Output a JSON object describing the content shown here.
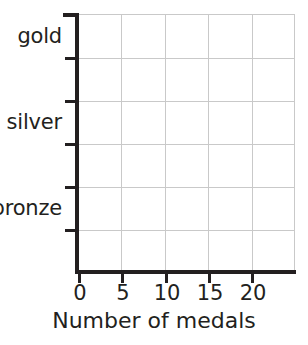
{
  "chart_data": {
    "type": "bar",
    "title": "",
    "xlabel": "Number of medals",
    "ylabel": "",
    "orientation": "horizontal",
    "categories": [
      "gold",
      "silver",
      "bronze"
    ],
    "values": [
      null,
      null,
      null
    ],
    "series": [
      {
        "name": "Number of medals",
        "values": [
          null,
          null,
          null
        ]
      }
    ],
    "x_ticks": [
      0,
      5,
      10,
      15,
      20
    ],
    "x_tick_labels": [
      "0",
      "5",
      "10",
      "15",
      "20"
    ],
    "xlim": [
      0,
      25
    ],
    "x_major_step": 5,
    "grid": "both",
    "grid_vertical_values": [
      5,
      10,
      15,
      20,
      25
    ],
    "y_band_count": 6,
    "legend": "none",
    "annotations": [],
    "note": "Empty grid template: axes, gridlines and labels only, no bars plotted.",
    "colors": {
      "axis": "#231f20",
      "gridline": "#c9c9c9",
      "text": "#231f20",
      "background": "#ffffff"
    }
  },
  "axis": {
    "x_title": "Number of medals",
    "x_tick_labels": [
      "0",
      "5",
      "10",
      "15",
      "20"
    ],
    "y_category_labels": [
      "gold",
      "silver",
      "bronze"
    ]
  }
}
